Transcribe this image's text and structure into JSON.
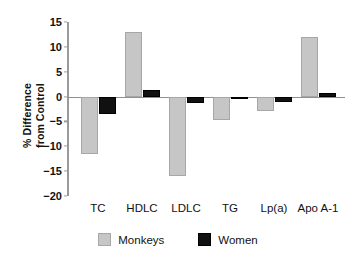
{
  "chart_data": {
    "type": "bar",
    "title": "",
    "xlabel": "",
    "ylabel": "% Difference\nfrom Control",
    "ylim": [
      -20,
      15
    ],
    "ytick_step": 5,
    "yticks": [
      "15",
      "10",
      "5",
      "0",
      "−5",
      "−10",
      "−15",
      "−20"
    ],
    "ytick_values": [
      15,
      10,
      5,
      0,
      -5,
      -10,
      -15,
      -20
    ],
    "grid": false,
    "zero_line": true,
    "categories": [
      "TC",
      "HDLC",
      "LDLC",
      "TG",
      "Lp(a)",
      "Apo A-1"
    ],
    "series": [
      {
        "name": "Monkeys",
        "color": "#c6c6c6",
        "edge_color": "#a7a7a7",
        "values": [
          -11.5,
          13.0,
          -16.0,
          -4.7,
          -3.0,
          12.0
        ]
      },
      {
        "name": "Women",
        "color": "#111111",
        "edge_color": "#000000",
        "values": [
          -3.5,
          1.3,
          -1.3,
          -0.1,
          -1.0,
          0.8
        ]
      }
    ],
    "legend": {
      "position": "bottom-center",
      "entries": [
        {
          "label": "Monkeys",
          "color": "#c6c6c6"
        },
        {
          "label": "Women",
          "color": "#111111"
        }
      ]
    }
  }
}
